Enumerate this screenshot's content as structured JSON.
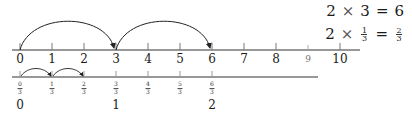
{
  "equations": {
    "eq1": {
      "lhs_a": "2",
      "op": "×",
      "lhs_b": "3",
      "eq": "=",
      "rhs": "6"
    },
    "eq2": {
      "lhs_a": "2",
      "op": "×",
      "frac_num": "1",
      "frac_den": "3",
      "eq": "=",
      "rhs_num": "2",
      "rhs_den": "3"
    }
  },
  "top_number_line": {
    "labels": [
      "0",
      "1",
      "2",
      "3",
      "4",
      "5",
      "6",
      "7",
      "8",
      "9",
      "10"
    ],
    "jumps": [
      {
        "from": "0",
        "to": "3"
      },
      {
        "from": "3",
        "to": "6"
      }
    ]
  },
  "bottom_number_line": {
    "fractions": [
      {
        "num": "0",
        "den": "3"
      },
      {
        "num": "1",
        "den": "3"
      },
      {
        "num": "2",
        "den": "3"
      },
      {
        "num": "3",
        "den": "3"
      },
      {
        "num": "4",
        "den": "3"
      },
      {
        "num": "5",
        "den": "3"
      },
      {
        "num": "6",
        "den": "3"
      }
    ],
    "wholes": [
      {
        "label": "0",
        "at_index": 0
      },
      {
        "label": "1",
        "at_index": 3
      },
      {
        "label": "2",
        "at_index": 6
      }
    ],
    "jumps": [
      {
        "from": "0/3",
        "to": "1/3"
      },
      {
        "from": "1/3",
        "to": "2/3"
      }
    ]
  },
  "colors": {
    "line": "#333333",
    "text": "#1a1a1a"
  }
}
